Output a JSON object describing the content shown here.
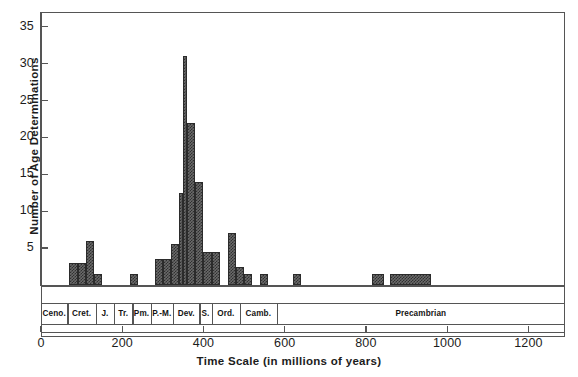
{
  "chart_data": {
    "type": "bar",
    "title": "",
    "xlabel": "Time Scale (in millions of years)",
    "ylabel": "Number of Age Determinations",
    "xlim": [
      0,
      1290
    ],
    "ylim": [
      0,
      37
    ],
    "grid": false,
    "legend": null,
    "y_ticks": [
      5,
      10,
      15,
      20,
      25,
      30,
      35
    ],
    "x_ticks": [
      0,
      200,
      400,
      600,
      800,
      1000,
      1200
    ],
    "bin_width": 20,
    "bins": [
      {
        "x0": 70,
        "x1": 90,
        "value": 3
      },
      {
        "x0": 90,
        "x1": 110,
        "value": 3
      },
      {
        "x0": 110,
        "x1": 130,
        "value": 6
      },
      {
        "x0": 130,
        "x1": 150,
        "value": 1.5
      },
      {
        "x0": 220,
        "x1": 240,
        "value": 1.5
      },
      {
        "x0": 280,
        "x1": 300,
        "value": 3.5
      },
      {
        "x0": 300,
        "x1": 320,
        "value": 3.5
      },
      {
        "x0": 320,
        "x1": 340,
        "value": 5.5
      },
      {
        "x0": 340,
        "x1": 350,
        "value": 12.5
      },
      {
        "x0": 350,
        "x1": 360,
        "value": 31
      },
      {
        "x0": 360,
        "x1": 380,
        "value": 22
      },
      {
        "x0": 380,
        "x1": 400,
        "value": 14
      },
      {
        "x0": 400,
        "x1": 420,
        "value": 4.5
      },
      {
        "x0": 420,
        "x1": 440,
        "value": 4.5
      },
      {
        "x0": 460,
        "x1": 480,
        "value": 7
      },
      {
        "x0": 480,
        "x1": 500,
        "value": 2.5
      },
      {
        "x0": 500,
        "x1": 520,
        "value": 1.5
      },
      {
        "x0": 540,
        "x1": 560,
        "value": 1.5
      },
      {
        "x0": 620,
        "x1": 640,
        "value": 1.5
      },
      {
        "x0": 815,
        "x1": 845,
        "value": 1.5
      },
      {
        "x0": 860,
        "x1": 960,
        "value": 1.5
      }
    ],
    "geologic_periods": [
      {
        "label": "Ceno.",
        "start": 0,
        "end": 65
      },
      {
        "label": "Cret.",
        "start": 65,
        "end": 135
      },
      {
        "label": "J.",
        "start": 135,
        "end": 180
      },
      {
        "label": "Tr.",
        "start": 180,
        "end": 225
      },
      {
        "label": "Pm.",
        "start": 225,
        "end": 270
      },
      {
        "label": "P.-M.",
        "start": 270,
        "end": 325
      },
      {
        "label": "Dev.",
        "start": 325,
        "end": 390
      },
      {
        "label": "S.",
        "start": 390,
        "end": 420
      },
      {
        "label": "Ord.",
        "start": 420,
        "end": 490
      },
      {
        "label": "Camb.",
        "start": 490,
        "end": 580
      },
      {
        "label": "Precambrian",
        "start": 580,
        "end": 1290
      }
    ]
  }
}
